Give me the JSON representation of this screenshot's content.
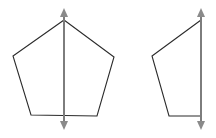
{
  "figure": {
    "canvas": {
      "width": 216,
      "height": 138,
      "background": "#ffffff"
    },
    "colors": {
      "outline": "#2b2b2b",
      "axis": "#7d7d7d",
      "arrow": "#8a8a8a",
      "background": "#ffffff"
    },
    "stroke_widths": {
      "outline": 1.1,
      "axis": 2.0
    },
    "shapes": [
      {
        "id": "left-pentagon",
        "name": "regular-pentagon",
        "label": "Pentagon with vertical line of symmetry",
        "points": "64,20 114,57 97,116 31,115 13,56 64,20",
        "closed": true
      },
      {
        "id": "right-half-pentagon",
        "name": "half-pentagon",
        "label": "Half pentagon bounded on the right by the symmetry axis",
        "points": "201,20 152,56 169,116 201,116",
        "closed": false
      }
    ],
    "axes": [
      {
        "id": "left-axis",
        "name": "vertical-symmetry-axis",
        "label": "Line of symmetry through left pentagon",
        "x": 64,
        "y_top": 13,
        "y_bottom": 125,
        "arrow_top": {
          "tip_x": 64,
          "tip_y": 8,
          "half_width": 4,
          "height": 9
        },
        "arrow_bottom": {
          "tip_x": 64,
          "tip_y": 130,
          "half_width": 4,
          "height": 9
        }
      },
      {
        "id": "right-axis",
        "name": "vertical-symmetry-axis",
        "label": "Line of symmetry at right edge of half pentagon",
        "x": 201,
        "y_top": 13,
        "y_bottom": 125,
        "arrow_top": {
          "tip_x": 201,
          "tip_y": 8,
          "half_width": 4,
          "height": 9
        },
        "arrow_bottom": {
          "tip_x": 201,
          "tip_y": 130,
          "half_width": 4,
          "height": 9
        }
      }
    ]
  }
}
